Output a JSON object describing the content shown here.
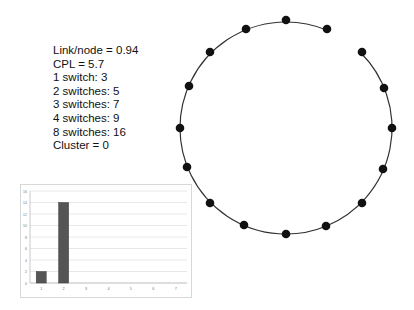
{
  "stats": {
    "lines": [
      "Link/node = 0.94",
      "CPL = 5.7",
      "1 switch: 3",
      "2 switches: 5",
      "3 switches: 7",
      "4 switches: 9",
      "8 switches: 16",
      "Cluster = 0"
    ]
  },
  "network": {
    "circle": {
      "cx": 286,
      "cy": 128,
      "r": 106
    },
    "node_count": 16,
    "gap_between": [
      [
        327,
        29
      ],
      [
        362,
        52
      ]
    ],
    "nodes": [
      [
        286,
        20
      ],
      [
        327,
        29
      ],
      [
        362,
        52
      ],
      [
        384,
        88
      ],
      [
        392,
        128
      ],
      [
        383,
        169
      ],
      [
        362,
        203
      ],
      [
        326,
        226
      ],
      [
        286,
        234
      ],
      [
        244,
        225
      ],
      [
        210,
        203
      ],
      [
        187,
        167
      ],
      [
        180,
        128
      ],
      [
        189,
        86
      ],
      [
        210,
        52
      ],
      [
        246,
        29
      ]
    ],
    "colors": {
      "node": "#111111",
      "edge": "#333333"
    }
  },
  "chart_data": {
    "type": "bar",
    "title": "",
    "xlabel": "",
    "ylabel": "",
    "categories": [
      "1",
      "2",
      "3",
      "4",
      "5",
      "6",
      "7"
    ],
    "values": [
      2,
      14,
      0,
      0,
      0,
      0,
      0
    ],
    "y_ticks": [
      "0",
      "2",
      "4",
      "6",
      "8",
      "10",
      "12",
      "14",
      "16"
    ],
    "ylim": [
      0,
      16
    ],
    "grid": true,
    "legend": false,
    "bar_color": "#555555"
  }
}
